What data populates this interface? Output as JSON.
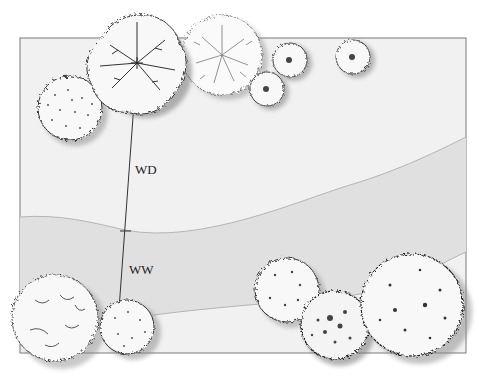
{
  "diagram": {
    "type": "landscape-plan",
    "labels": {
      "wd": "WD",
      "ww": "WW"
    },
    "colors": {
      "background": "#ffffff",
      "field": "#f1f1f1",
      "band": "#e0e0e0",
      "band_edge": "#b5b5b5",
      "frame": "#7a7a7a",
      "tree_fill": "#f7f7f7",
      "tree_stroke": "#3a3a3a",
      "shadow": "#8a8a8a"
    },
    "frame": {
      "x": 20,
      "y": 38,
      "width": 446,
      "height": 315
    },
    "measure_line": {
      "x1": 137,
      "y1": 62,
      "x2": 118,
      "y2": 323,
      "ticks_y": [
        62,
        231,
        323
      ]
    },
    "trees": [
      {
        "name": "large-deciduous-top-left",
        "cx": 137,
        "cy": 63,
        "r": 48
      },
      {
        "name": "round-shrub-left",
        "cx": 70,
        "cy": 108,
        "r": 33
      },
      {
        "name": "fine-texture-tree-top",
        "cx": 222,
        "cy": 55,
        "r": 40
      },
      {
        "name": "small-shrub-1",
        "cx": 290,
        "cy": 60,
        "r": 18
      },
      {
        "name": "small-shrub-2",
        "cx": 267,
        "cy": 89,
        "r": 18
      },
      {
        "name": "small-shrub-3",
        "cx": 353,
        "cy": 57,
        "r": 18
      },
      {
        "name": "irregular-tree-bottom-left",
        "cx": 55,
        "cy": 318,
        "r": 44
      },
      {
        "name": "round-shrub-bottom",
        "cx": 127,
        "cy": 327,
        "r": 28
      },
      {
        "name": "shrub-bottom-mid",
        "cx": 287,
        "cy": 290,
        "r": 33
      },
      {
        "name": "dense-shrub-bottom",
        "cx": 335,
        "cy": 325,
        "r": 35
      },
      {
        "name": "large-tree-bottom-right",
        "cx": 412,
        "cy": 305,
        "r": 52
      }
    ]
  }
}
